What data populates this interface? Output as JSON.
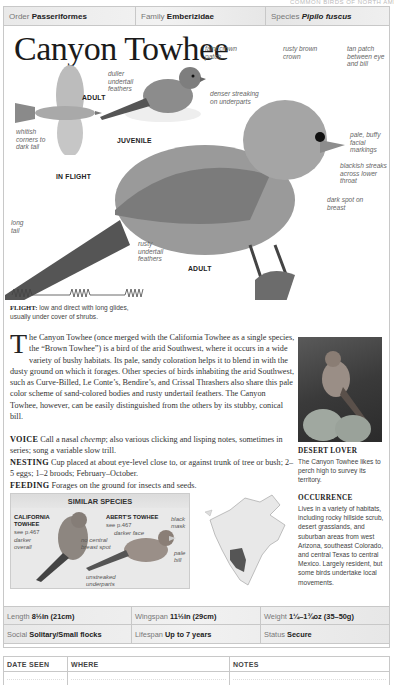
{
  "header_strip": "COMMON BIRDS OF NORTH AMERICA",
  "taxonomy": {
    "order_label": "Order",
    "order_value": "Passeriformes",
    "family_label": "Family",
    "family_value": "Emberizidae",
    "species_label": "Species",
    "species_value": "Pipilo fuscus"
  },
  "title": "Canyon Towhee",
  "illustrations": {
    "flight": {
      "caption": "IN FLIGHT",
      "age": "ADULT",
      "labels": [
        "whitish corners to dark tail"
      ]
    },
    "juvenile": {
      "caption": "JUVENILE",
      "labels": [
        "duller undertail feathers",
        "faint crown patch",
        "denser streaking on underparts"
      ]
    },
    "adult": {
      "caption": "ADULT",
      "labels": [
        "rusty brown crown",
        "tan patch between eye and bill",
        "pale, buffy facial markings",
        "blackish streaks across lower throat",
        "dark spot on breast",
        "long tail",
        "rusty undertail feathers"
      ]
    }
  },
  "flight": {
    "label": "FLIGHT:",
    "text": "low and direct with long glides, usually under cover of shrubs."
  },
  "description": {
    "dropcap": "T",
    "text": "he Canyon Towhee (once merged with the California Towhee as a single species, the “Brown Towhee”) is a bird of the arid Southwest, where it occurs in a wide variety of bushy habitats. Its pale, sandy coloration helps it to blend in with the dusty ground on which it forages. Other species of birds inhabiting the arid Southwest, such as Curve-Billed, Le Conte’s, Bendire’s, and Crissal Thrashers also share this pale color scheme of sand-colored bodies and rusty undertail feathers. The Canyon Towhee, however, can be easily distinguished from the others by its stubby, conical bill."
  },
  "voice": {
    "label": "VOICE",
    "text_before": "Call a nasal ",
    "call": "cheemp",
    "text_after": "; also various clicking and lisping notes, sometimes in series; song a variable slow trill."
  },
  "nesting": {
    "label": "NESTING",
    "text": "Cup placed at about eye-level close to, or against trunk of tree or bush; 2–5 eggs; 1–2 broods; February–October."
  },
  "feeding": {
    "label": "FEEDING",
    "text": "Forages on the ground for insects and seeds."
  },
  "photo": {
    "title": "DESERT LOVER",
    "caption": "The Canyon Towhee likes to perch high to survey its territory."
  },
  "occurrence": {
    "title": "OCCURRENCE",
    "text": "Lives in a variety of habitats, including rocky hillside scrub, desert grasslands, and suburban areas from west Arizona, southeast Colorado, and central Texas to central Mexico. Largely resident, but some birds undertake local movements."
  },
  "similar_species": {
    "title": "SIMILAR SPECIES",
    "species": [
      {
        "name_line1": "CALIFORNIA",
        "name_line2": "TOWHEE",
        "ref": "see p.467",
        "labels": [
          "darker overall",
          "no central breast spot"
        ]
      },
      {
        "name_line1": "ABERT’S TOWHEE",
        "name_line2": "",
        "ref": "see p.467",
        "labels": [
          "darker face",
          "black mask",
          "pale bill",
          "unstreaked underparts"
        ]
      }
    ]
  },
  "stats": {
    "length_label": "Length",
    "length_value": "8½in (21cm)",
    "wingspan_label": "Wingspan",
    "wingspan_value": "11½in (29cm)",
    "weight_label": "Weight",
    "weight_value": "1¼–1¾oz (35–50g)",
    "social_label": "Social",
    "social_value": "Solitary/Small flocks",
    "lifespan_label": "Lifespan",
    "lifespan_value": "Up to 7 years",
    "status_label": "Status",
    "status_value": "Secure"
  },
  "log": {
    "columns": [
      "DATE SEEN",
      "WHERE",
      "NOTES"
    ]
  }
}
